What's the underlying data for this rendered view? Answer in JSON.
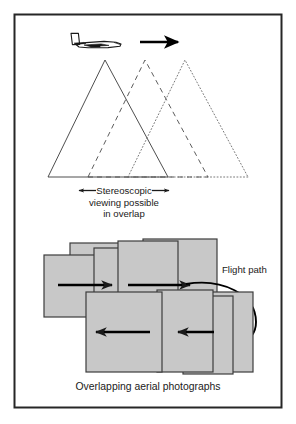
{
  "figure": {
    "title_none": "",
    "frame": {
      "color": "#262626",
      "x": 14,
      "y": 14,
      "width": 268,
      "height": 394
    }
  },
  "top_panel": {
    "airplane_icon": "airplane-side-view-icon",
    "direction_arrow_icon": "flight-direction-arrow-icon",
    "footprints": [
      {
        "name": "photo-footprint-1",
        "style": "solid",
        "apex_x": 105,
        "base_left": 48,
        "base_right": 168
      },
      {
        "name": "photo-footprint-2",
        "style": "dashed",
        "apex_x": 145,
        "base_left": 88,
        "base_right": 208
      },
      {
        "name": "photo-footprint-3",
        "style": "dotted",
        "apex_x": 185,
        "base_left": 128,
        "base_right": 248
      }
    ],
    "baseline_y": 177,
    "apex_y": 60,
    "overlap_bracket": {
      "left_x": 78,
      "right_x": 170,
      "y": 190
    },
    "caption_line_1": "Stereoscopic",
    "caption_line_2": "viewing possible",
    "caption_line_3": "in overlap"
  },
  "bottom_panel": {
    "photo_fill_color": "#c8c8c8",
    "photo_border_color": "#3c3c3c",
    "photos_row_top": [
      {
        "name": "aerial-photo-1",
        "x": 44,
        "y": 255,
        "width": 52,
        "height": 62
      },
      {
        "name": "aerial-photo-2",
        "x": 70,
        "y": 243,
        "width": 58,
        "height": 70
      },
      {
        "name": "aerial-photo-3",
        "x": 94,
        "y": 248,
        "width": 56,
        "height": 66
      },
      {
        "name": "aerial-photo-4",
        "x": 118,
        "y": 241,
        "width": 60,
        "height": 72
      },
      {
        "name": "aerial-photo-5",
        "x": 143,
        "y": 239,
        "width": 74,
        "height": 76
      }
    ],
    "photos_row_bottom": [
      {
        "name": "aerial-photo-6",
        "x": 86,
        "y": 292,
        "width": 76,
        "height": 80
      },
      {
        "name": "aerial-photo-7",
        "x": 157,
        "y": 290,
        "width": 56,
        "height": 82
      },
      {
        "name": "aerial-photo-8",
        "x": 183,
        "y": 296,
        "width": 50,
        "height": 78
      },
      {
        "name": "aerial-photo-9",
        "x": 205,
        "y": 292,
        "width": 48,
        "height": 80
      }
    ],
    "arrows": [
      {
        "name": "strip-arrow-right-1",
        "x1": 58,
        "y1": 285,
        "x2": 112,
        "y2": 285
      },
      {
        "name": "strip-arrow-right-2",
        "x1": 128,
        "y1": 285,
        "x2": 190,
        "y2": 285
      },
      {
        "name": "strip-arrow-left-1",
        "x1": 150,
        "y1": 332,
        "x2": 96,
        "y2": 332
      },
      {
        "name": "strip-arrow-left-2",
        "x1": 212,
        "y1": 332,
        "x2": 178,
        "y2": 332
      }
    ],
    "flight_path_label": "Flight path",
    "flight_path_curve_name": "flight-path-curve",
    "caption": "Overlapping aerial photographs"
  }
}
